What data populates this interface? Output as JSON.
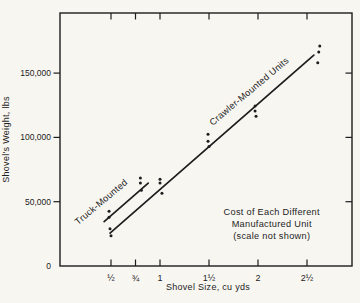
{
  "figure": {
    "background_color": "#f8f6f1",
    "ink_color": "#1d1d1d"
  },
  "chart_data": {
    "type": "scatter",
    "title": "",
    "xlabel": "Shovel Size, cu yds",
    "ylabel": "Shovel's Weight, lbs",
    "xlim": [
      0,
      2.96
    ],
    "ylim": [
      0,
      196000
    ],
    "grid": false,
    "frame": "box-with-ticks-all-sides",
    "legend_position": "inline-rotated-labels",
    "x_ticks": [
      {
        "value": 0.5,
        "label": "½"
      },
      {
        "value": 0.75,
        "label": "¾"
      },
      {
        "value": 1,
        "label": "1"
      },
      {
        "value": 1.5,
        "label": "1½"
      },
      {
        "value": 2,
        "label": "2"
      },
      {
        "value": 2.5,
        "label": "2½"
      }
    ],
    "y_ticks": [
      {
        "value": 0,
        "label": "0",
        "tick": false
      },
      {
        "value": 50000,
        "label": "50,000",
        "tick": true
      },
      {
        "value": 100000,
        "label": "100,000",
        "tick": true
      },
      {
        "value": 150000,
        "label": "150,000",
        "tick": true
      }
    ],
    "series": [
      {
        "name": "Truck-Mounted",
        "points": [
          [
            0.48,
            42500
          ],
          [
            0.48,
            38000
          ],
          [
            0.8,
            68500
          ],
          [
            0.8,
            64500
          ],
          [
            0.81,
            59000
          ]
        ],
        "trend_line": {
          "x1": 0.43,
          "y1": 34500,
          "x2": 0.88,
          "y2": 64500
        },
        "label": {
          "text": "Truck-Mounted",
          "x": 0.42,
          "y": 48000,
          "angle": -40
        }
      },
      {
        "name": "Crawler-Mounted Units",
        "points": [
          [
            0.49,
            29000
          ],
          [
            0.5,
            23500
          ],
          [
            1.0,
            67500
          ],
          [
            1.0,
            64500
          ],
          [
            1.02,
            56500
          ],
          [
            1.49,
            102500
          ],
          [
            1.49,
            97000
          ],
          [
            1.5,
            93000
          ],
          [
            1.97,
            124500
          ],
          [
            1.97,
            120500
          ],
          [
            1.98,
            116500
          ],
          [
            2.63,
            171000
          ],
          [
            2.62,
            166500
          ],
          [
            2.61,
            158000
          ]
        ],
        "trend_line": {
          "x1": 0.49,
          "y1": 25500,
          "x2": 2.57,
          "y2": 164000
        },
        "label": {
          "text": "Crawler-Mounted Units",
          "x": 1.93,
          "y": 134000,
          "angle": -40
        }
      }
    ],
    "annotation": {
      "lines": [
        "Cost of Each Different",
        "Manufactured Unit",
        "(scale not shown)"
      ],
      "x": 2.14,
      "y": 32500
    }
  }
}
